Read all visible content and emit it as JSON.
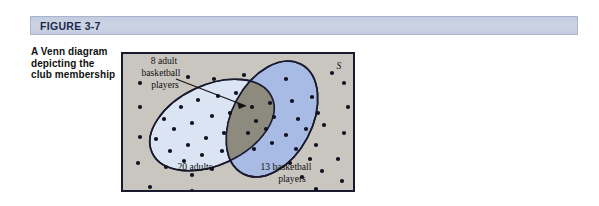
{
  "figure": {
    "header_label": "FIGURE 3-7",
    "caption": "A Venn diagram depicting the club membership"
  },
  "diagram": {
    "type": "venn",
    "universe_label": "S",
    "labels": {
      "intersection": "8 adult basketball players",
      "left_set": "20 adults",
      "right_set": "13 basketball players"
    },
    "counts": {
      "adults_only_region_label": "20 adults",
      "basketball_only_region_label": "13 basketball players",
      "intersection_label": "8 adult basketball players",
      "adults_total": 20,
      "basketball_total": 13,
      "intersection_total": 8
    },
    "colors": {
      "universe_background": "#c9c6c0",
      "left_ellipse_fill": "#dbe4f2",
      "right_ellipse_fill": "#a8bbe4",
      "intersection_fill": "#8d8a7e",
      "outline": "#1a1a2e",
      "dot": "#111122",
      "header_band": "#c6cee2",
      "header_text": "#1b2a4a"
    },
    "dots": {
      "left_only": [
        [
          38,
          56
        ],
        [
          55,
          44
        ],
        [
          72,
          37
        ],
        [
          92,
          33
        ],
        [
          110,
          30
        ],
        [
          30,
          76
        ],
        [
          48,
          66
        ],
        [
          66,
          60
        ],
        [
          86,
          53
        ],
        [
          104,
          50
        ],
        [
          44,
          88
        ],
        [
          62,
          82
        ],
        [
          80,
          75
        ],
        [
          98,
          70
        ],
        [
          40,
          104
        ],
        [
          58,
          98
        ],
        [
          76,
          92
        ],
        [
          96,
          88
        ],
        [
          66,
          112
        ],
        [
          86,
          106
        ]
      ],
      "intersection": [
        [
          126,
          44
        ],
        [
          144,
          40
        ],
        [
          130,
          58
        ],
        [
          148,
          54
        ],
        [
          122,
          70
        ],
        [
          140,
          66
        ],
        [
          128,
          86
        ],
        [
          146,
          80
        ]
      ],
      "right_only": [
        [
          166,
          38
        ],
        [
          186,
          34
        ],
        [
          172,
          56
        ],
        [
          192,
          50
        ],
        [
          160,
          72
        ],
        [
          180,
          66
        ],
        [
          198,
          62
        ],
        [
          170,
          86
        ],
        [
          190,
          82
        ],
        [
          164,
          100
        ],
        [
          184,
          96
        ],
        [
          176,
          114
        ],
        [
          196,
          108
        ]
      ],
      "outside": [
        [
          14,
          20
        ],
        [
          62,
          14
        ],
        [
          118,
          12
        ],
        [
          160,
          16
        ],
        [
          206,
          10
        ],
        [
          14,
          44
        ],
        [
          218,
          20
        ],
        [
          222,
          44
        ],
        [
          218,
          70
        ],
        [
          212,
          96
        ],
        [
          216,
          118
        ],
        [
          190,
          126
        ],
        [
          150,
          130
        ],
        [
          108,
          132
        ],
        [
          66,
          128
        ],
        [
          24,
          124
        ],
        [
          12,
          100
        ],
        [
          14,
          74
        ],
        [
          42,
          132
        ],
        [
          88,
          16
        ]
      ]
    }
  }
}
